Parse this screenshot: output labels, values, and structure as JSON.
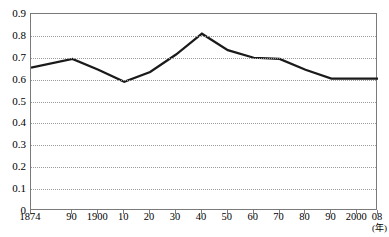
{
  "chart_data": {
    "type": "line",
    "title": "",
    "xlabel": "(年)",
    "ylabel": "",
    "grid": true,
    "legend": false,
    "xlim": [
      1874,
      2008
    ],
    "ylim": [
      0,
      0.9
    ],
    "ytick_step": 0.1,
    "x": [
      1874,
      1890,
      1900,
      1910,
      1920,
      1930,
      1940,
      1950,
      1960,
      1970,
      1980,
      1990,
      2000,
      2008
    ],
    "xticklabels": [
      "1874",
      "90",
      "1900",
      "10",
      "20",
      "30",
      "40",
      "50",
      "60",
      "70",
      "80",
      "90",
      "2000",
      "08"
    ],
    "yticklabels": [
      "0",
      "0.1",
      "0.2",
      "0.3",
      "0.4",
      "0.5",
      "0.6",
      "0.7",
      "0.8",
      "0.9"
    ],
    "yticks": [
      0,
      0.1,
      0.2,
      0.3,
      0.4,
      0.5,
      0.6,
      0.7,
      0.8,
      0.9
    ],
    "series": [
      {
        "name": "series-1",
        "color": "#1a1a1a",
        "values": [
          0.655,
          0.695,
          0.645,
          0.59,
          0.635,
          0.715,
          0.81,
          0.735,
          0.7,
          0.695,
          0.645,
          0.605,
          0.605,
          0.605
        ]
      }
    ]
  },
  "axis": {
    "unit_label": "(年)"
  }
}
